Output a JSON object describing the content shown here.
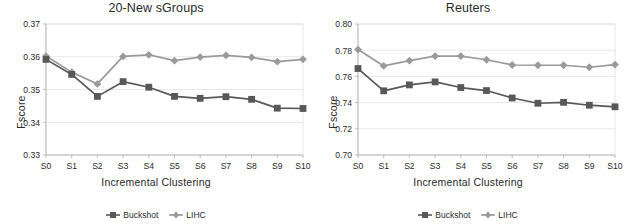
{
  "figure": {
    "series_names": [
      "Buckshot",
      "LIHC"
    ],
    "colors": {
      "buckshot": "#585858",
      "lihc": "#9a9a9a",
      "axis": "#bdbdbd",
      "grid": "#e2e2e2",
      "text": "#2a2a2a"
    }
  },
  "charts": [
    {
      "id": "newsgroups",
      "title": "20-New sGroups",
      "xlabel": "Incremental Clustering",
      "ylabel": "Fscore",
      "ylim": [
        0.33,
        0.37
      ],
      "yticks": [
        "0.33",
        "0.34",
        "0.35",
        "0.36",
        "0.37"
      ],
      "xticks": [
        "S0",
        "S1",
        "S2",
        "S3",
        "S4",
        "S5",
        "S6",
        "S7",
        "S8",
        "S9",
        "S10"
      ],
      "legend": [
        "Buckshot",
        "LIHC"
      ]
    },
    {
      "id": "reuters",
      "title": "Reuters",
      "xlabel": "Incremental Clustering",
      "ylabel": "Fscore",
      "ylim": [
        0.7,
        0.8
      ],
      "yticks": [
        "0.70",
        "0.72",
        "0.74",
        "0.76",
        "0.78",
        "0.80"
      ],
      "xticks": [
        "S0",
        "S1",
        "S2",
        "S3",
        "S4",
        "S5",
        "S6",
        "S7",
        "S8",
        "S9",
        "S10"
      ],
      "legend": [
        "Buckshot",
        "LIHC"
      ]
    }
  ],
  "chart_data": [
    {
      "type": "line",
      "title": "20-New sGroups",
      "xlabel": "Incremental Clustering",
      "ylabel": "Fscore",
      "categories": [
        "S0",
        "S1",
        "S2",
        "S3",
        "S4",
        "S5",
        "S6",
        "S7",
        "S8",
        "S9",
        "S10"
      ],
      "ylim": [
        0.33,
        0.37
      ],
      "ytick_values": [
        0.33,
        0.34,
        0.35,
        0.36,
        0.37
      ],
      "grid": true,
      "legend_position": "bottom",
      "series": [
        {
          "name": "Buckshot",
          "marker": "square",
          "color": "#585858",
          "values": [
            0.3592,
            0.3546,
            0.3479,
            0.3524,
            0.3507,
            0.3479,
            0.3473,
            0.3478,
            0.347,
            0.3443,
            0.3442
          ]
        },
        {
          "name": "LIHC",
          "marker": "diamond",
          "color": "#9a9a9a",
          "values": [
            0.3602,
            0.3553,
            0.3517,
            0.3601,
            0.3606,
            0.3588,
            0.3599,
            0.3604,
            0.3598,
            0.3585,
            0.3592
          ]
        }
      ]
    },
    {
      "type": "line",
      "title": "Reuters",
      "xlabel": "Incremental Clustering",
      "ylabel": "Fscore",
      "categories": [
        "S0",
        "S1",
        "S2",
        "S3",
        "S4",
        "S5",
        "S6",
        "S7",
        "S8",
        "S9",
        "S10"
      ],
      "ylim": [
        0.7,
        0.8
      ],
      "ytick_values": [
        0.7,
        0.72,
        0.74,
        0.76,
        0.78,
        0.8
      ],
      "grid": true,
      "legend_position": "bottom",
      "series": [
        {
          "name": "Buckshot",
          "marker": "square",
          "color": "#585858",
          "values": [
            0.766,
            0.749,
            0.7535,
            0.7558,
            0.7515,
            0.7492,
            0.7435,
            0.7395,
            0.7402,
            0.738,
            0.7368
          ]
        },
        {
          "name": "LIHC",
          "marker": "diamond",
          "color": "#9a9a9a",
          "values": [
            0.7805,
            0.768,
            0.772,
            0.7755,
            0.7755,
            0.7727,
            0.7687,
            0.7685,
            0.7685,
            0.767,
            0.769
          ]
        }
      ]
    }
  ]
}
